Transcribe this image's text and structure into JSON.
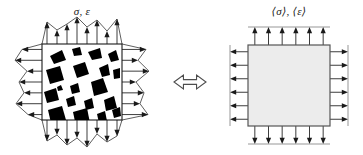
{
  "figure": {
    "type": "mechanics-schematic",
    "background_color": "#ffffff",
    "line_color": "#1a1a1a",
    "inclusion_color": "#000000",
    "homogeneous_fill": "#ececec",
    "width": 363,
    "height": 155
  },
  "left_panel": {
    "name": "heterogeneous-rve",
    "label": "σ, ε",
    "label_x": 82,
    "label_y": 15,
    "square": {
      "x": 42,
      "y": 44,
      "w": 80,
      "h": 76
    },
    "fill": "#ffffff",
    "stroke": "#1a1a1a",
    "traction_profile": "non-uniform",
    "arrow_counts": {
      "top": 8,
      "bottom": 8,
      "left": 7,
      "right": 7
    },
    "arrow_lengths": {
      "top": [
        22,
        14,
        20,
        27,
        17,
        24,
        13,
        25
      ],
      "bottom": [
        21,
        15,
        25,
        18,
        27,
        14,
        22,
        16
      ],
      "left": [
        20,
        27,
        15,
        23,
        18,
        26,
        14
      ],
      "right": [
        24,
        16,
        27,
        14,
        22,
        18,
        26
      ]
    },
    "inclusions": [
      {
        "points": "8,12 20,6 24,16 12,20",
        "cx": 16,
        "cy": 13
      },
      {
        "points": "30,5 38,3 40,11 32,12",
        "cx": 35,
        "cy": 7
      },
      {
        "points": "46,8 58,4 60,14 50,16",
        "cx": 53,
        "cy": 10
      },
      {
        "points": "66,10 74,6 77,16 69,18",
        "cx": 71,
        "cy": 12
      },
      {
        "points": "4,26 18,22 22,36 8,40",
        "cx": 13,
        "cy": 31
      },
      {
        "points": "31,22 43,18 47,30 35,34",
        "cx": 39,
        "cy": 26
      },
      {
        "points": "57,24 66,20 68,31 60,33",
        "cx": 62,
        "cy": 27
      },
      {
        "points": "71,26 78,24 78,34 72,35",
        "cx": 75,
        "cy": 30
      },
      {
        "points": "15,43 19,41 21,46 16,47",
        "cx": 18,
        "cy": 44
      },
      {
        "points": "28,42 36,39 38,48 30,50",
        "cx": 33,
        "cy": 45
      },
      {
        "points": "49,38 61,34 66,48 52,52",
        "cx": 57,
        "cy": 43
      },
      {
        "points": "2,48 14,44 17,56 5,59",
        "cx": 9,
        "cy": 52
      },
      {
        "points": "24,55 32,52 34,61 26,63",
        "cx": 29,
        "cy": 58
      },
      {
        "points": "42,57 50,54 52,64 44,66",
        "cx": 47,
        "cy": 60
      },
      {
        "points": "62,56 72,52 75,64 64,67",
        "cx": 68,
        "cy": 60
      },
      {
        "points": "6,66 20,62 24,76 9,79",
        "cx": 15,
        "cy": 70
      },
      {
        "points": "31,68 45,64 48,79 34,82",
        "cx": 39,
        "cy": 73
      },
      {
        "points": "55,70 63,67 65,77 57,79",
        "cx": 60,
        "cy": 73
      },
      {
        "points": "70,66 78,63 79,72 72,74",
        "cx": 75,
        "cy": 69
      },
      {
        "points": "26,85 34,82 36,90 28,92",
        "cx": 31,
        "cy": 87
      },
      {
        "points": "44,86 56,84 58,91 46,92",
        "cx": 51,
        "cy": 88
      },
      {
        "points": "62,84 74,82 76,89 64,90",
        "cx": 69,
        "cy": 86
      },
      {
        "points": "10,86 15,84 16,89 11,90",
        "cx": 13,
        "cy": 87
      }
    ]
  },
  "right_panel": {
    "name": "homogenized-medium",
    "label": "⟨σ⟩, ⟨ε⟩",
    "label_x": 289,
    "label_y": 15,
    "square": {
      "x": 248,
      "y": 45,
      "w": 82,
      "h": 81
    },
    "fill": "#ececec",
    "stroke": "#555555",
    "traction_profile": "uniform",
    "arrow_counts": {
      "top": 6,
      "bottom": 6,
      "left": 6,
      "right": 6
    },
    "arrow_length": 18
  },
  "equivalence": {
    "name": "equivalence-arrow",
    "symbol": "⟺",
    "x": 190,
    "y": 82,
    "half_width": 16,
    "half_height": 7,
    "stroke": "#4d4d4d",
    "fill": "#ffffff"
  }
}
